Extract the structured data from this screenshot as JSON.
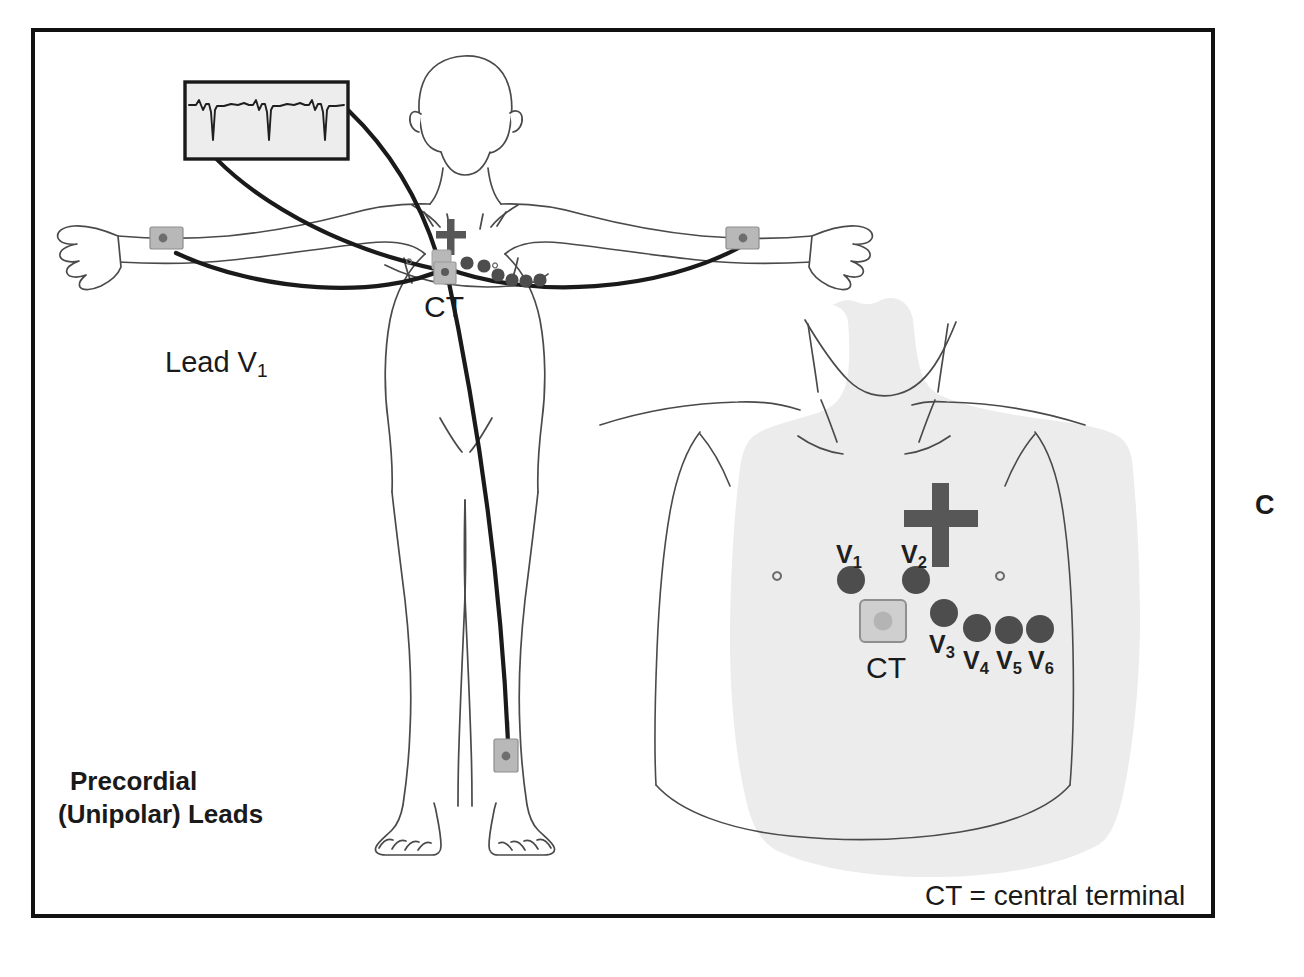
{
  "figure": {
    "panel_letter": "C",
    "title_line_1": "Precordial",
    "title_line_2": "(Unipolar) Leads",
    "legend": "CT = central terminal",
    "lead_label": "Lead V",
    "lead_label_sub": "1",
    "ct_label_left": "CT",
    "ct_label_right": "CT",
    "background_color": "#ffffff",
    "border_color": "#111111",
    "body_outline_color": "#4a4a4a",
    "torso_fill_color": "#ececec",
    "electrode_dot_color": "#4d4d4d",
    "electrode_pad_color": "#b8b8b8",
    "lead_wire_color": "#1a1a1a",
    "cross_marker_color": "#575757",
    "ecg_strip_fill": "#ededed",
    "text_color": "#1a1a1a"
  },
  "ecg_strip": {
    "name": "ECG waveform V1 rhythm strip",
    "beats": 3,
    "morphology": "small r wave with deep S wave"
  },
  "precordial_leads": [
    {
      "id": "V1",
      "letter": "V",
      "sub": "1"
    },
    {
      "id": "V2",
      "letter": "V",
      "sub": "2"
    },
    {
      "id": "V3",
      "letter": "V",
      "sub": "3"
    },
    {
      "id": "V4",
      "letter": "V",
      "sub": "4"
    },
    {
      "id": "V5",
      "letter": "V",
      "sub": "5"
    },
    {
      "id": "V6",
      "letter": "V",
      "sub": "6"
    }
  ],
  "electrodes": {
    "left_figure": {
      "left_wrist": "limb electrode",
      "right_wrist": "limb electrode",
      "left_leg": "limb electrode",
      "central_terminal": "CT",
      "chest_dots": 6
    },
    "right_figure": {
      "central_terminal": "CT",
      "chest_dots": 6
    }
  }
}
